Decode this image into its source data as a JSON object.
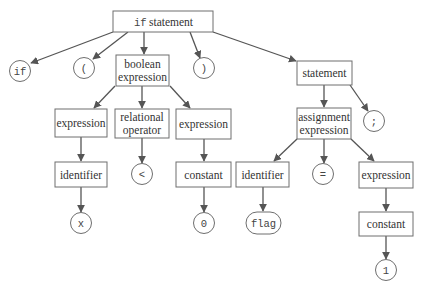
{
  "colors": {
    "node_stroke": "#6e6e6e",
    "edge": "#555555",
    "text": "#333333",
    "background": "#ffffff"
  },
  "nodes": {
    "root": {
      "line1": "if",
      "line2": "statement",
      "shape": "box"
    },
    "kw_if": {
      "label": "if",
      "shape": "circle"
    },
    "lparen": {
      "label": "(",
      "shape": "circle"
    },
    "bool_expr": {
      "line1": "boolean",
      "line2": "expression",
      "shape": "box"
    },
    "rparen": {
      "label": ")",
      "shape": "circle"
    },
    "statement": {
      "label": "statement",
      "shape": "box"
    },
    "expr1": {
      "label": "expression",
      "shape": "box"
    },
    "rel_op": {
      "line1": "relational",
      "line2": "operator",
      "shape": "box"
    },
    "expr2": {
      "label": "expression",
      "shape": "box"
    },
    "assign_expr": {
      "line1": "assignment",
      "line2": "expression",
      "shape": "box"
    },
    "semicolon": {
      "label": ";",
      "shape": "circle"
    },
    "ident1": {
      "label": "identifier",
      "shape": "box"
    },
    "lt": {
      "label": "<",
      "shape": "circle"
    },
    "const1": {
      "label": "constant",
      "shape": "box"
    },
    "ident2": {
      "label": "identifier",
      "shape": "box"
    },
    "eq": {
      "label": "=",
      "shape": "circle"
    },
    "expr3": {
      "label": "expression",
      "shape": "box"
    },
    "x": {
      "label": "x",
      "shape": "circle"
    },
    "zero": {
      "label": "0",
      "shape": "circle"
    },
    "flag": {
      "label": "flag",
      "shape": "pill"
    },
    "const2": {
      "label": "constant",
      "shape": "box"
    },
    "one": {
      "label": "1",
      "shape": "circle"
    }
  },
  "edges": [
    [
      "root",
      "kw_if"
    ],
    [
      "root",
      "lparen"
    ],
    [
      "root",
      "bool_expr"
    ],
    [
      "root",
      "rparen"
    ],
    [
      "root",
      "statement"
    ],
    [
      "bool_expr",
      "expr1"
    ],
    [
      "bool_expr",
      "rel_op"
    ],
    [
      "bool_expr",
      "expr2"
    ],
    [
      "statement",
      "assign_expr"
    ],
    [
      "statement",
      "semicolon"
    ],
    [
      "expr1",
      "ident1"
    ],
    [
      "rel_op",
      "lt"
    ],
    [
      "expr2",
      "const1"
    ],
    [
      "assign_expr",
      "ident2"
    ],
    [
      "assign_expr",
      "eq"
    ],
    [
      "assign_expr",
      "expr3"
    ],
    [
      "ident1",
      "x"
    ],
    [
      "const1",
      "zero"
    ],
    [
      "ident2",
      "flag"
    ],
    [
      "expr3",
      "const2"
    ],
    [
      "const2",
      "one"
    ]
  ]
}
